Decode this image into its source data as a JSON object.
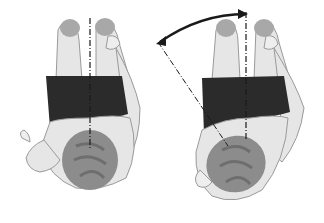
{
  "figure": {
    "panels": [
      {
        "id": "left",
        "label": "",
        "state": "neutral"
      },
      {
        "id": "right",
        "label": "",
        "state": "rotated"
      }
    ],
    "colors": {
      "background": "#ffffff",
      "skin": "#e6e6e6",
      "skin_outline": "#9a9a9a",
      "shorts": "#2b2b2b",
      "hair": "#8c8c8c",
      "hair_dark": "#6e6e6e",
      "shoes": "#a8a8a8",
      "line": "#1a1a1a"
    }
  }
}
